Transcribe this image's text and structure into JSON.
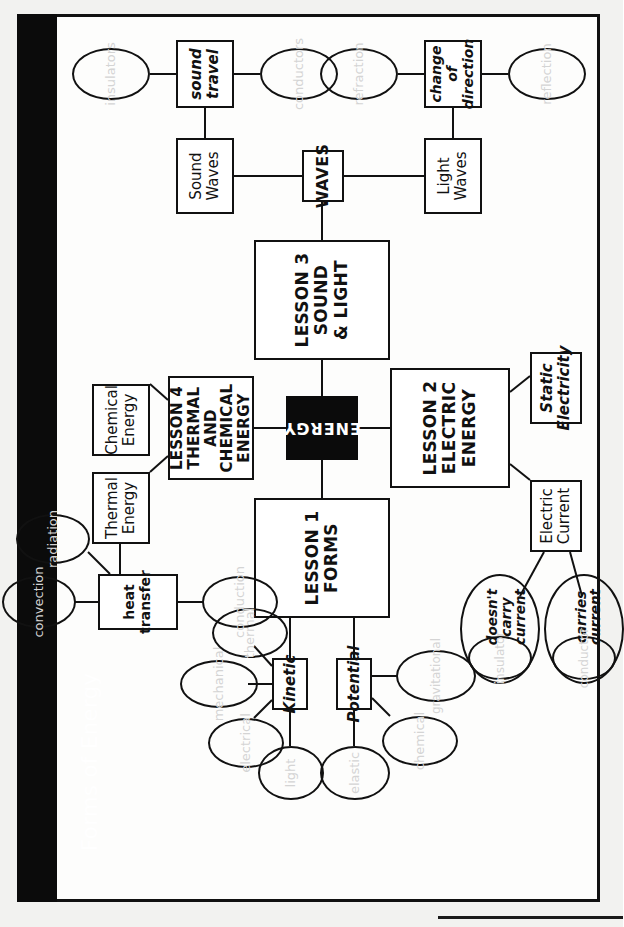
{
  "document": {
    "title_bar_label": "Forms of Energy",
    "ghost_header": "Chapter 1 Test: Energy",
    "ghost_number": "9"
  },
  "diagram": {
    "type": "concept-map",
    "root": {
      "label": "ENERGY",
      "style": "black-filled"
    },
    "lessons": [
      {
        "id": "lesson1",
        "label": "LESSON 1\nFORMS"
      },
      {
        "id": "lesson2",
        "label": "LESSON 2\nELECTRIC\nENERGY"
      },
      {
        "id": "lesson3",
        "label": "LESSON 3\nSOUND\n& LIGHT"
      },
      {
        "id": "lesson4",
        "label": "LESSON 4\nTHERMAL AND\nCHEMICAL ENERGY"
      }
    ],
    "nodes": {
      "kinetic": "Kinetic",
      "potential": "Potential",
      "heat_transfer": "heat transfer",
      "thermal_energy": "Thermal\nEnergy",
      "chemical_energy": "Chemical\nEnergy",
      "electric_current": "Electric\nCurrent",
      "static_electricity": "Static\nElectricity",
      "waves": "WAVES",
      "sound_waves": "Sound\nWaves",
      "light_waves": "Light\nWaves",
      "sound_travel": "sound\ntravel",
      "change_of_direction": "change of\ndirection"
    },
    "blanks": [
      {
        "id": "blank-light",
        "answer": "light",
        "attached_to": "kinetic"
      },
      {
        "id": "blank-electrical",
        "answer": "electrical",
        "attached_to": "kinetic"
      },
      {
        "id": "blank-mechanical",
        "answer": "mechanical",
        "attached_to": "kinetic"
      },
      {
        "id": "blank-thermal",
        "answer": "thermal",
        "attached_to": "kinetic"
      },
      {
        "id": "blank-elastic",
        "answer": "elastic",
        "attached_to": "potential"
      },
      {
        "id": "blank-chemical",
        "answer": "chemical",
        "attached_to": "potential"
      },
      {
        "id": "blank-gravitational",
        "answer": "gravitational",
        "attached_to": "potential"
      },
      {
        "id": "blank-convection",
        "answer": "convection",
        "attached_to": "heat_transfer"
      },
      {
        "id": "blank-radiation",
        "answer": "radiation",
        "attached_to": "heat_transfer"
      },
      {
        "id": "blank-conduction",
        "answer": "conduction",
        "attached_to": "heat_transfer"
      },
      {
        "id": "blank-conductor",
        "answer": "conductor",
        "label": "carries current",
        "attached_to": "electric_current"
      },
      {
        "id": "blank-insulator",
        "answer": "insulator",
        "label": "doesn't carry current",
        "attached_to": "electric_current"
      },
      {
        "id": "blank-insulators",
        "answer": "insulators",
        "attached_to": "sound_travel"
      },
      {
        "id": "blank-conductors",
        "answer": "conductors",
        "attached_to": "sound_travel"
      },
      {
        "id": "blank-refraction",
        "answer": "refraction",
        "attached_to": "change_of_direction"
      },
      {
        "id": "blank-reflection",
        "answer": "reflection",
        "attached_to": "change_of_direction"
      }
    ],
    "edges": [
      [
        "ENERGY",
        "LESSON 1 FORMS"
      ],
      [
        "ENERGY",
        "LESSON 2 ELECTRIC ENERGY"
      ],
      [
        "ENERGY",
        "LESSON 3 SOUND & LIGHT"
      ],
      [
        "ENERGY",
        "LESSON 4 THERMAL AND CHEMICAL ENERGY"
      ],
      [
        "LESSON 1 FORMS",
        "Kinetic"
      ],
      [
        "LESSON 1 FORMS",
        "Potential"
      ],
      [
        "LESSON 4 THERMAL AND CHEMICAL ENERGY",
        "Thermal Energy"
      ],
      [
        "LESSON 4 THERMAL AND CHEMICAL ENERGY",
        "Chemical Energy"
      ],
      [
        "Thermal Energy",
        "heat transfer"
      ],
      [
        "LESSON 2 ELECTRIC ENERGY",
        "Electric Current"
      ],
      [
        "LESSON 2 ELECTRIC ENERGY",
        "Static Electricity"
      ],
      [
        "LESSON 3 SOUND & LIGHT",
        "WAVES"
      ],
      [
        "WAVES",
        "Sound Waves"
      ],
      [
        "WAVES",
        "Light Waves"
      ],
      [
        "Sound Waves",
        "sound travel"
      ],
      [
        "Light Waves",
        "change of direction"
      ]
    ],
    "colors": {
      "ink": "#111111",
      "paper": "#fdfdfc",
      "blank_text": "#d4d4d4",
      "root_fill": "#0b0b0b",
      "title_bar": "#0b0b0b",
      "title_text": "#ffffff"
    }
  }
}
